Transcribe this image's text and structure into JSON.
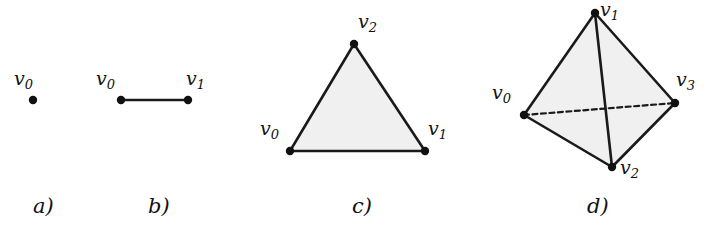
{
  "figure": {
    "width": 712,
    "height": 228,
    "background": "#ffffff",
    "stroke_color": "#1a1a1a",
    "fill_color": "#f0f0f0",
    "dot_color": "#111111"
  },
  "panels": [
    {
      "id": "a",
      "caption": "a)",
      "caption_x": 33,
      "caption_y": 196,
      "description": "0-simplex: a single point",
      "vertices": [
        {
          "name": "v0",
          "base": "v",
          "sub": "0",
          "x": 33,
          "y": 100,
          "label_x": 14,
          "label_y": 69
        }
      ],
      "edges": [],
      "faces": []
    },
    {
      "id": "b",
      "caption": "b)",
      "caption_x": 148,
      "caption_y": 196,
      "description": "1-simplex: a line segment",
      "vertices": [
        {
          "name": "v0",
          "base": "v",
          "sub": "0",
          "x": 121,
          "y": 100,
          "label_x": 96,
          "label_y": 69
        },
        {
          "name": "v1",
          "base": "v",
          "sub": "1",
          "x": 188,
          "y": 100,
          "label_x": 186,
          "label_y": 69
        }
      ],
      "edges": [
        {
          "from": 0,
          "to": 1,
          "style": "solid"
        }
      ],
      "faces": []
    },
    {
      "id": "c",
      "caption": "c)",
      "caption_x": 352,
      "caption_y": 196,
      "description": "2-simplex: a filled triangle",
      "vertices": [
        {
          "name": "v0",
          "base": "v",
          "sub": "0",
          "x": 290,
          "y": 151,
          "label_x": 260,
          "label_y": 119
        },
        {
          "name": "v1",
          "base": "v",
          "sub": "1",
          "x": 425,
          "y": 151,
          "label_x": 428,
          "label_y": 119
        },
        {
          "name": "v2",
          "base": "v",
          "sub": "2",
          "x": 354,
          "y": 44,
          "label_x": 358,
          "label_y": 12
        }
      ],
      "edges": [
        {
          "from": 0,
          "to": 1,
          "style": "solid"
        },
        {
          "from": 1,
          "to": 2,
          "style": "solid"
        },
        {
          "from": 2,
          "to": 0,
          "style": "solid"
        }
      ],
      "faces": [
        {
          "vertices": [
            0,
            1,
            2
          ]
        }
      ]
    },
    {
      "id": "d",
      "caption": "d)",
      "caption_x": 587,
      "caption_y": 196,
      "description": "3-simplex: a tetrahedron with hidden edge dashed",
      "vertices": [
        {
          "name": "v0",
          "base": "v",
          "sub": "0",
          "x": 524,
          "y": 115,
          "label_x": 492,
          "label_y": 83
        },
        {
          "name": "v1",
          "base": "v",
          "sub": "1",
          "x": 595,
          "y": 13,
          "label_x": 600,
          "label_y": 0
        },
        {
          "name": "v2",
          "base": "v",
          "sub": "2",
          "x": 612,
          "y": 167,
          "label_x": 620,
          "label_y": 158
        },
        {
          "name": "v3",
          "base": "v",
          "sub": "3",
          "x": 675,
          "y": 103,
          "label_x": 676,
          "label_y": 70
        }
      ],
      "edges": [
        {
          "from": 0,
          "to": 1,
          "style": "solid"
        },
        {
          "from": 1,
          "to": 3,
          "style": "solid"
        },
        {
          "from": 0,
          "to": 2,
          "style": "solid"
        },
        {
          "from": 2,
          "to": 3,
          "style": "solid"
        },
        {
          "from": 1,
          "to": 2,
          "style": "solid"
        },
        {
          "from": 0,
          "to": 3,
          "style": "dashed"
        }
      ],
      "faces": [
        {
          "vertices": [
            0,
            1,
            2
          ]
        },
        {
          "vertices": [
            1,
            2,
            3
          ]
        }
      ]
    }
  ]
}
